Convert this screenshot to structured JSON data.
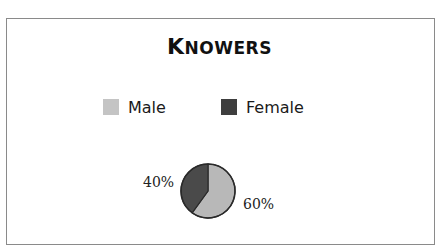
{
  "chart_data": {
    "type": "pie",
    "title": "Knowers",
    "categories": [
      "Male",
      "Female"
    ],
    "values": [
      60,
      40
    ],
    "labels": [
      "60%",
      "40%"
    ],
    "colors": [
      "#b8b8b8",
      "#4a4a4a"
    ],
    "legend_position": "top",
    "start_angle": "12 o'clock",
    "direction": "Male clockwise from top, Female counterclockwise from top"
  },
  "title": {
    "first_letter": "K",
    "rest": "NOWERS"
  },
  "legend": {
    "items": [
      {
        "label": "Male",
        "color": "#c4c4c4"
      },
      {
        "label": "Female",
        "color": "#3e3e3e"
      }
    ]
  },
  "pie": {
    "male_label": "60%",
    "female_label": "40%"
  }
}
